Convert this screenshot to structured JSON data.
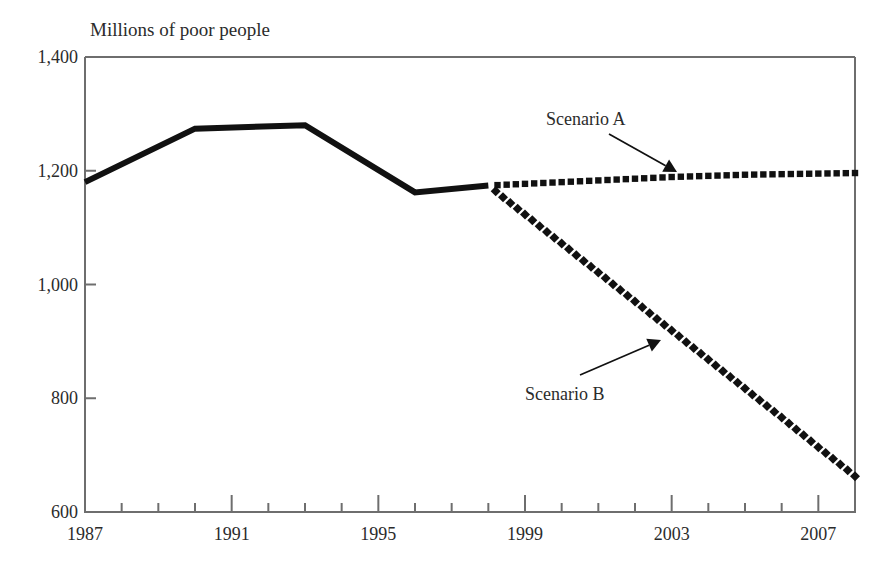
{
  "chart_data": {
    "type": "line",
    "title": "Millions of poor people",
    "xlabel": "",
    "ylabel": "",
    "xlim": [
      1987,
      2008
    ],
    "ylim": [
      600,
      1400
    ],
    "grid": false,
    "legend_position": "inline-annotations",
    "y_ticks": [
      "1,400",
      "1,200",
      "1,000",
      "800",
      "600"
    ],
    "y_tick_values": [
      1400,
      1200,
      1000,
      800,
      600
    ],
    "x_ticks": [
      "1987",
      "1991",
      "1995",
      "1999",
      "2003",
      "2007"
    ],
    "x_tick_values": [
      1987,
      1991,
      1995,
      1999,
      2003,
      2007
    ],
    "x_minor_tick_values": [
      1988,
      1989,
      1990,
      1992,
      1993,
      1994,
      1996,
      1997,
      1998,
      2000,
      2001,
      2002,
      2004,
      2005,
      2006,
      2008
    ],
    "series": [
      {
        "name": "Historical",
        "style": "solid",
        "x": [
          1987,
          1990,
          1993,
          1996,
          1998
        ],
        "values": [
          1180,
          1274,
          1280,
          1162,
          1174
        ]
      },
      {
        "name": "Scenario A",
        "style": "dotted-square",
        "x": [
          1998,
          1999,
          2000,
          2001,
          2002,
          2003,
          2004,
          2005,
          2006,
          2007,
          2008
        ],
        "values": [
          1174,
          1177,
          1180,
          1183,
          1186,
          1189,
          1191,
          1193,
          1194,
          1195,
          1196
        ]
      },
      {
        "name": "Scenario B",
        "style": "dotted-diamond",
        "x": [
          1998,
          1999,
          2000,
          2001,
          2002,
          2003,
          2004,
          2005,
          2006,
          2007,
          2008
        ],
        "values": [
          1174,
          1123,
          1072,
          1021,
          970,
          919,
          868,
          817,
          766,
          714,
          663
        ]
      }
    ],
    "annotations": [
      {
        "text": "Scenario A",
        "target_series": "Scenario A"
      },
      {
        "text": "Scenario B",
        "target_series": "Scenario B"
      }
    ]
  },
  "colors": {
    "line": "#111111",
    "axis": "#6e6e6e",
    "text": "#2b2b2b",
    "background": "#ffffff"
  }
}
